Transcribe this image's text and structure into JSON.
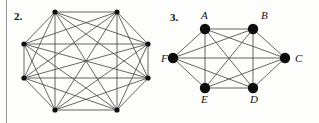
{
  "page": {
    "background_color": "#fdfdfb",
    "rule_color": "#9a9a9a",
    "edge_color": "#4a4a4a",
    "node_color": "#0d0d0d",
    "label_color": "#111111"
  },
  "figures": [
    {
      "number": "2.",
      "graph_name": "complete-graph-octagon",
      "vertex_count": 8,
      "edge_count": 28,
      "labels": [],
      "vertices": [
        {
          "id": "v1",
          "x": 55,
          "y": 12,
          "label": ""
        },
        {
          "id": "v2",
          "x": 117,
          "y": 12,
          "label": ""
        },
        {
          "id": "v3",
          "x": 148,
          "y": 44,
          "label": ""
        },
        {
          "id": "v4",
          "x": 148,
          "y": 78,
          "label": ""
        },
        {
          "id": "v5",
          "x": 117,
          "y": 110,
          "label": ""
        },
        {
          "id": "v6",
          "x": 55,
          "y": 110,
          "label": ""
        },
        {
          "id": "v7",
          "x": 24,
          "y": 78,
          "label": ""
        },
        {
          "id": "v8",
          "x": 24,
          "y": 44,
          "label": ""
        }
      ],
      "node_radius": 2.6
    },
    {
      "number": "3.",
      "graph_name": "complete-graph-hexagon",
      "vertex_count": 6,
      "edge_count": 15,
      "labels": [
        "A",
        "B",
        "C",
        "D",
        "E",
        "F"
      ],
      "vertices": [
        {
          "id": "A",
          "x": 45,
          "y": 29,
          "label": "A",
          "label_x": 41,
          "label_y": 19
        },
        {
          "id": "B",
          "x": 93,
          "y": 29,
          "label": "B",
          "label_x": 101,
          "label_y": 19
        },
        {
          "id": "C",
          "x": 125,
          "y": 58,
          "label": "C",
          "label_x": 135,
          "label_y": 62
        },
        {
          "id": "D",
          "x": 93,
          "y": 88,
          "label": "D",
          "label_x": 90,
          "label_y": 103
        },
        {
          "id": "E",
          "x": 45,
          "y": 88,
          "label": "E",
          "label_x": 41,
          "label_y": 103
        },
        {
          "id": "F",
          "x": 13,
          "y": 58,
          "label": "F",
          "label_x": 1,
          "label_y": 62
        }
      ],
      "node_radius": 5.2
    }
  ]
}
